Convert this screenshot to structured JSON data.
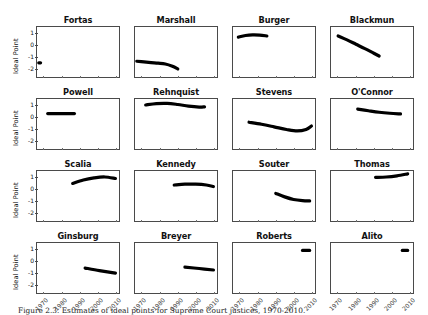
{
  "figure": {
    "caption": "Figure 2.3. Estimates of ideal points for Supreme Court justices, 1970-2010.",
    "y_axis_label": "Ideal Point",
    "y_ticks": [
      "1",
      "0",
      "-1",
      "-2"
    ],
    "x_ticks": [
      "1970",
      "1980",
      "1990",
      "2000",
      "2010"
    ],
    "line_color": "#000000",
    "axis_color": "#4a4a4a"
  },
  "chart_data": {
    "type": "line",
    "title": "Estimates of ideal points for Supreme Court justices",
    "xlabel": "",
    "ylabel": "Ideal Point",
    "xlim": [
      1966,
      2012
    ],
    "ylim": [
      -2.75,
      1.6
    ],
    "grid": false,
    "legend": "none",
    "layout": {
      "rows": 4,
      "cols": 4
    },
    "panels": [
      {
        "name": "Fortas",
        "row": 0,
        "col": 0,
        "x": [
          1967,
          1968
        ],
        "y": [
          -1.52,
          -1.52
        ]
      },
      {
        "name": "Marshall",
        "row": 0,
        "col": 1,
        "x": [
          1967,
          1971,
          1975,
          1979,
          1983,
          1987,
          1990
        ],
        "y": [
          -1.38,
          -1.44,
          -1.5,
          -1.55,
          -1.62,
          -1.82,
          -2.05
        ]
      },
      {
        "name": "Burger",
        "row": 0,
        "col": 2,
        "x": [
          1969,
          1973,
          1977,
          1981,
          1985
        ],
        "y": [
          0.72,
          0.86,
          0.92,
          0.9,
          0.82
        ]
      },
      {
        "name": "Blackmun",
        "row": 0,
        "col": 3,
        "x": [
          1970,
          1975,
          1980,
          1985,
          1990,
          1993
        ],
        "y": [
          0.82,
          0.48,
          0.1,
          -0.28,
          -0.68,
          -0.92
        ]
      },
      {
        "name": "Powell",
        "row": 1,
        "col": 0,
        "x": [
          1972,
          1978,
          1984,
          1987
        ],
        "y": [
          0.33,
          0.33,
          0.33,
          0.33
        ]
      },
      {
        "name": "Rehnquist",
        "row": 1,
        "col": 1,
        "x": [
          1972,
          1978,
          1984,
          1990,
          1996,
          2002,
          2005
        ],
        "y": [
          1.08,
          1.2,
          1.22,
          1.12,
          0.98,
          0.9,
          0.92
        ]
      },
      {
        "name": "Stevens",
        "row": 1,
        "col": 2,
        "x": [
          1975,
          1982,
          1989,
          1996,
          2002,
          2007,
          2010
        ],
        "y": [
          -0.42,
          -0.6,
          -0.82,
          -1.05,
          -1.18,
          -1.05,
          -0.75
        ]
      },
      {
        "name": "O'Connor",
        "row": 1,
        "col": 3,
        "x": [
          1981,
          1987,
          1993,
          1999,
          2005
        ],
        "y": [
          0.72,
          0.58,
          0.45,
          0.36,
          0.3
        ]
      },
      {
        "name": "Scalia",
        "row": 2,
        "col": 0,
        "x": [
          1986,
          1992,
          1998,
          2004,
          2010
        ],
        "y": [
          0.52,
          0.82,
          1.0,
          1.08,
          0.95
        ]
      },
      {
        "name": "Kennedy",
        "row": 2,
        "col": 1,
        "x": [
          1988,
          1994,
          2000,
          2006,
          2010
        ],
        "y": [
          0.38,
          0.45,
          0.45,
          0.38,
          0.25
        ]
      },
      {
        "name": "Souter",
        "row": 2,
        "col": 2,
        "x": [
          1990,
          1995,
          2000,
          2005,
          2009
        ],
        "y": [
          -0.35,
          -0.65,
          -0.88,
          -0.98,
          -1.0
        ]
      },
      {
        "name": "Thomas",
        "row": 2,
        "col": 3,
        "x": [
          1991,
          1997,
          2003,
          2009
        ],
        "y": [
          1.05,
          1.08,
          1.18,
          1.35
        ]
      },
      {
        "name": "Ginsburg",
        "row": 3,
        "col": 0,
        "x": [
          1993,
          2001,
          2010
        ],
        "y": [
          -0.58,
          -0.8,
          -1.02
        ]
      },
      {
        "name": "Breyer",
        "row": 3,
        "col": 1,
        "x": [
          1994,
          2002,
          2010
        ],
        "y": [
          -0.5,
          -0.62,
          -0.75
        ]
      },
      {
        "name": "Roberts",
        "row": 3,
        "col": 2,
        "x": [
          2005,
          2009
        ],
        "y": [
          0.95,
          0.95
        ]
      },
      {
        "name": "Alito",
        "row": 3,
        "col": 3,
        "x": [
          2006,
          2009
        ],
        "y": [
          0.95,
          0.95
        ]
      }
    ]
  }
}
